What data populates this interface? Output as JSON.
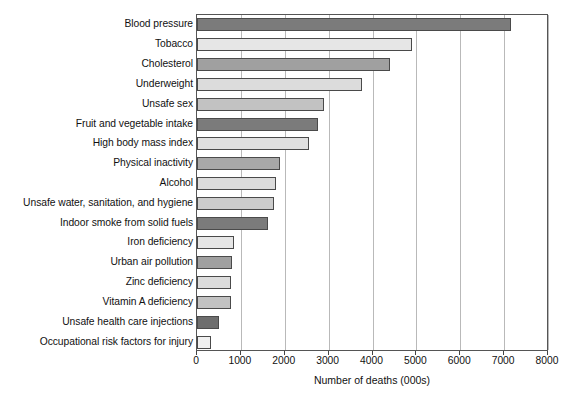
{
  "chart_data": {
    "type": "bar",
    "orientation": "horizontal",
    "title": "",
    "xlabel": "Number of deaths (000s)",
    "ylabel": "",
    "xlim": [
      0,
      8000
    ],
    "xticks": [
      0,
      1000,
      2000,
      3000,
      4000,
      5000,
      6000,
      7000,
      8000
    ],
    "xtick_labels": [
      "0",
      "1000",
      "2000",
      "3000",
      "4000",
      "5000",
      "6000",
      "7000",
      "8000"
    ],
    "grid": "vertical",
    "legend": "none",
    "categories": [
      "Blood pressure",
      "Tobacco",
      "Cholesterol",
      "Underweight",
      "Unsafe sex",
      "Fruit and vegetable intake",
      "High body mass index",
      "Physical inactivity",
      "Alcohol",
      "Unsafe water, sanitation, and hygiene",
      "Indoor smoke from solid fuels",
      "Iron deficiency",
      "Urban air pollution",
      "Zinc deficiency",
      "Vitamin A deficiency",
      "Unsafe health care injections",
      "Occupational risk factors for injury"
    ],
    "values": [
      7150,
      4900,
      4400,
      3750,
      2900,
      2750,
      2550,
      1900,
      1800,
      1750,
      1620,
      850,
      800,
      780,
      780,
      510,
      310
    ],
    "bar_colors": [
      "#7b7b7b",
      "#e6e6e6",
      "#a0a0a0",
      "#dcdcdc",
      "#c2c2c2",
      "#7b7b7b",
      "#e0e0e0",
      "#a8a8a8",
      "#dcdcdc",
      "#cccccc",
      "#7b7b7b",
      "#e6e6e6",
      "#a0a0a0",
      "#dcdcdc",
      "#c2c2c2",
      "#6e6e6e",
      "#f0f0f0"
    ],
    "bar_edge_color": "#4a4a4a",
    "gridline_color": "#b9b9b9",
    "axis_color": "#555555",
    "background_color": "#ffffff"
  }
}
